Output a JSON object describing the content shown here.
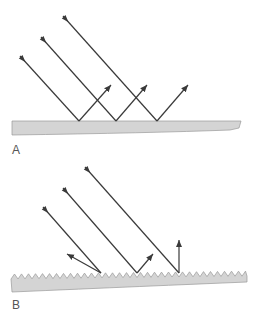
{
  "panels": [
    {
      "label": "A",
      "surface_type": "smooth",
      "incident_rays": [
        {
          "start": [
            20,
            56
          ],
          "hit": [
            79,
            121
          ]
        },
        {
          "start": [
            41,
            37
          ],
          "hit": [
            116,
            121
          ]
        },
        {
          "start": [
            63,
            16
          ],
          "hit": [
            157,
            121
          ]
        }
      ],
      "reflected_rays": [
        {
          "from": [
            79,
            121
          ],
          "to": [
            111,
            85
          ]
        },
        {
          "from": [
            116,
            121
          ],
          "to": [
            147,
            85
          ]
        },
        {
          "from": [
            157,
            121
          ],
          "to": [
            188,
            85
          ]
        }
      ]
    },
    {
      "label": "B",
      "surface_type": "rough",
      "incident_rays": [
        {
          "start": [
            43,
            207
          ],
          "hit": [
            101,
            273
          ]
        },
        {
          "start": [
            63,
            188
          ],
          "hit": [
            137,
            273
          ]
        },
        {
          "start": [
            85,
            167
          ],
          "hit": [
            179,
            273
          ]
        }
      ],
      "reflected_rays": [
        {
          "from": [
            101,
            273
          ],
          "to": [
            67,
            254
          ]
        },
        {
          "from": [
            137,
            273
          ],
          "to": [
            153,
            254
          ]
        },
        {
          "from": [
            179,
            273
          ],
          "to": [
            179,
            240
          ]
        }
      ]
    }
  ],
  "colors": {
    "ray": "#3a3a3a",
    "surface_fill": "#d4d4d4",
    "surface_stroke": "#9a9a9a",
    "label": "#555555"
  }
}
